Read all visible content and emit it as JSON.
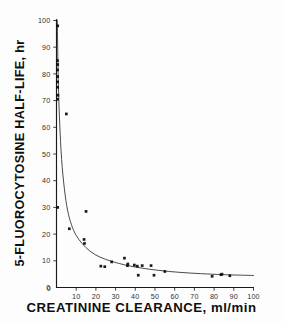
{
  "figure": {
    "background_color": "#fdfdfd",
    "ink_color": "#1a1a1a"
  },
  "axes": {
    "y_title": "5-FLUOROCYTOSINE HALF-LIFE, hr",
    "x_title": "CREATININE CLEARANCE, ml/min",
    "y_ticks": [
      "0",
      "10",
      "20",
      "30",
      "40",
      "50",
      "60",
      "70",
      "80",
      "90",
      "100"
    ],
    "x_ticks": [
      "0",
      "10",
      "20",
      "30",
      "40",
      "50",
      "60",
      "70",
      "80",
      "90",
      "100"
    ]
  },
  "chart_data": {
    "type": "scatter",
    "title": "",
    "xlabel": "CREATININE CLEARANCE, ml/min",
    "ylabel": "5-FLUOROCYTOSINE HALF-LIFE, hr",
    "xlim": [
      0,
      100
    ],
    "ylim": [
      0,
      100
    ],
    "x_tick_step": 10,
    "y_tick_step": 10,
    "grid": false,
    "legend": null,
    "marker": "filled-square",
    "series": [
      {
        "name": "patients",
        "points": [
          {
            "x": 0.6,
            "y": 98.0
          },
          {
            "x": 0.5,
            "y": 85.0
          },
          {
            "x": 0.6,
            "y": 83.5
          },
          {
            "x": 0.5,
            "y": 81.5
          },
          {
            "x": 0.6,
            "y": 79.0
          },
          {
            "x": 0.5,
            "y": 77.0
          },
          {
            "x": 0.6,
            "y": 75.0
          },
          {
            "x": 0.7,
            "y": 72.0
          },
          {
            "x": 0.5,
            "y": 70.5
          },
          {
            "x": 0.6,
            "y": 30.0
          },
          {
            "x": 5.0,
            "y": 65.0
          },
          {
            "x": 6.5,
            "y": 22.0
          },
          {
            "x": 15.0,
            "y": 28.5
          },
          {
            "x": 14.0,
            "y": 18.0
          },
          {
            "x": 14.2,
            "y": 16.5
          },
          {
            "x": 22.5,
            "y": 8.0
          },
          {
            "x": 24.5,
            "y": 7.8
          },
          {
            "x": 28.0,
            "y": 9.6
          },
          {
            "x": 34.5,
            "y": 11.0
          },
          {
            "x": 36.0,
            "y": 8.2
          },
          {
            "x": 36.2,
            "y": 8.8
          },
          {
            "x": 39.5,
            "y": 8.4
          },
          {
            "x": 41.0,
            "y": 8.0
          },
          {
            "x": 41.5,
            "y": 4.6
          },
          {
            "x": 43.5,
            "y": 8.2
          },
          {
            "x": 48.0,
            "y": 8.2
          },
          {
            "x": 49.5,
            "y": 4.6
          },
          {
            "x": 55.0,
            "y": 6.0
          },
          {
            "x": 79.0,
            "y": 4.2
          },
          {
            "x": 83.5,
            "y": 4.8
          },
          {
            "x": 84.0,
            "y": 5.0
          },
          {
            "x": 88.0,
            "y": 4.4
          }
        ]
      }
    ],
    "fit_curve": {
      "name": "fitted hyperbolic decay",
      "points": [
        {
          "x": 0.4,
          "y": 100.0
        },
        {
          "x": 0.9,
          "y": 78.0
        },
        {
          "x": 1.6,
          "y": 62.0
        },
        {
          "x": 2.6,
          "y": 48.0
        },
        {
          "x": 4.0,
          "y": 37.0
        },
        {
          "x": 5.6,
          "y": 29.0
        },
        {
          "x": 7.6,
          "y": 23.5
        },
        {
          "x": 10.0,
          "y": 19.5
        },
        {
          "x": 13.0,
          "y": 16.5
        },
        {
          "x": 17.0,
          "y": 13.6
        },
        {
          "x": 22.0,
          "y": 11.4
        },
        {
          "x": 28.0,
          "y": 9.8
        },
        {
          "x": 35.0,
          "y": 8.4
        },
        {
          "x": 43.0,
          "y": 7.3
        },
        {
          "x": 52.0,
          "y": 6.4
        },
        {
          "x": 62.0,
          "y": 5.7
        },
        {
          "x": 73.0,
          "y": 5.2
        },
        {
          "x": 85.0,
          "y": 4.8
        },
        {
          "x": 100.0,
          "y": 4.5
        }
      ]
    }
  }
}
